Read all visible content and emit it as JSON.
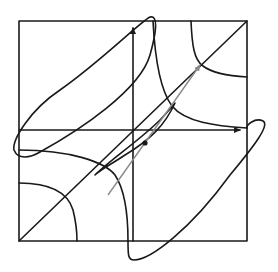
{
  "diagram": {
    "type": "phase-plane",
    "frame": {
      "left": 19,
      "top": 21,
      "right": 247,
      "bottom": 241
    },
    "origin": {
      "x": 133,
      "y": 130
    },
    "colors": {
      "ink": "#1a1a1a",
      "vector": "#8a8a8a",
      "background": "#ffffff"
    },
    "elements": [
      {
        "name": "bounding-box",
        "kind": "rectangle"
      },
      {
        "name": "x-axis",
        "kind": "arrow",
        "label": ""
      },
      {
        "name": "y-axis",
        "kind": "arrow",
        "label": ""
      },
      {
        "name": "diagonal",
        "kind": "line"
      },
      {
        "name": "upper-right-hyperbola",
        "kind": "curve"
      },
      {
        "name": "middle-hyperbola",
        "kind": "curve"
      },
      {
        "name": "lower-left-curve",
        "kind": "curve"
      },
      {
        "name": "large-closed-loop",
        "kind": "closed-curve"
      },
      {
        "name": "small-ellipse",
        "kind": "closed-curve"
      },
      {
        "name": "gray-vector",
        "kind": "arrow"
      },
      {
        "name": "marked-point",
        "kind": "dot",
        "x": 145,
        "y": 143
      }
    ]
  }
}
